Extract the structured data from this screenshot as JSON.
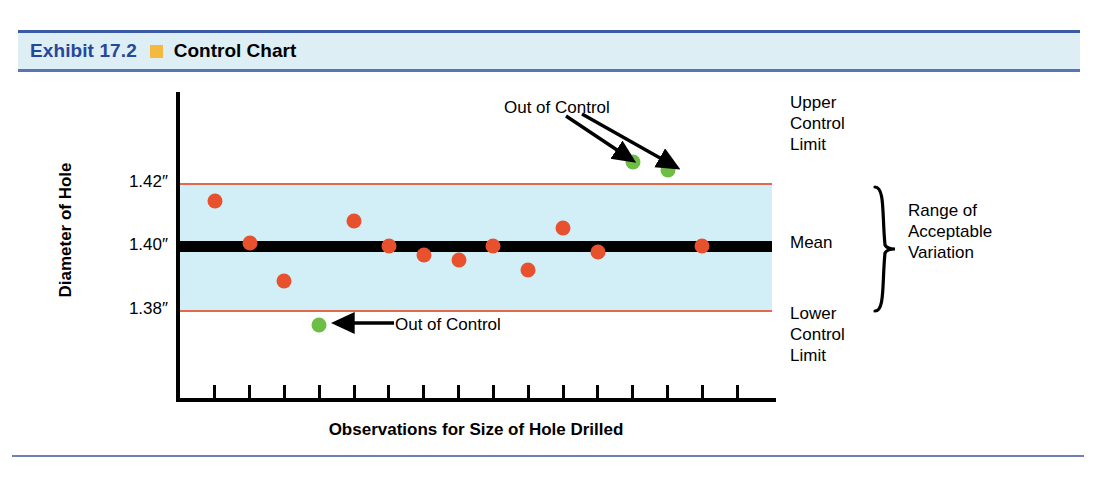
{
  "header": {
    "exhibit_number": "Exhibit 17.2",
    "title": "Control Chart",
    "bullet_color": "#f5b942",
    "number_color": "#27479b",
    "banner_color": "#ddeef4",
    "rule_color": "#3c5ba6"
  },
  "chart_data": {
    "type": "scatter",
    "title": "Control Chart",
    "xlabel": "Observations for Size of Hole Drilled",
    "ylabel": "Diameter of Hole",
    "ytick_labels": [
      "1.42″",
      "1.40″",
      "1.38″"
    ],
    "ytick_values": [
      1.42,
      1.4,
      1.38
    ],
    "ylim": [
      1.365,
      1.435
    ],
    "grid": false,
    "legend": "none",
    "n_x_ticks": 16,
    "reference_lines": [
      {
        "name": "upper-control-limit",
        "label": "Upper\nControl\nLimit",
        "value": 1.42,
        "color": "#e06a4a"
      },
      {
        "name": "mean",
        "label": "Mean",
        "value": 1.4,
        "color": "#000000"
      },
      {
        "name": "lower-control-limit",
        "label": "Lower\nControl\nLimit",
        "value": 1.38,
        "color": "#e06a4a"
      }
    ],
    "band_label": "Range of\nAcceptable\nVariation",
    "band_color": "#d2eef6",
    "series": [
      {
        "name": "in-control",
        "color": "#e8512e",
        "points": [
          {
            "x": 1,
            "y": 1.4145
          },
          {
            "x": 2,
            "y": 1.4015
          },
          {
            "x": 3,
            "y": 1.3895
          },
          {
            "x": 5,
            "y": 1.4085
          },
          {
            "x": 6,
            "y": 1.4005
          },
          {
            "x": 7,
            "y": 1.3975
          },
          {
            "x": 8,
            "y": 1.396
          },
          {
            "x": 9,
            "y": 1.4005
          },
          {
            "x": 10,
            "y": 1.393
          },
          {
            "x": 11,
            "y": 1.406
          },
          {
            "x": 12,
            "y": 1.3985
          },
          {
            "x": 15,
            "y": 1.4005
          }
        ]
      },
      {
        "name": "out-of-control",
        "color": "#6cbe45",
        "points": [
          {
            "x": 4,
            "y": 1.3755
          },
          {
            "x": 13,
            "y": 1.427
          },
          {
            "x": 14,
            "y": 1.4245
          }
        ]
      }
    ],
    "annotations": [
      {
        "name": "out-of-control-upper",
        "text": "Out of Control",
        "arrows": 2
      },
      {
        "name": "out-of-control-lower",
        "text": "Out of Control",
        "arrows": 1
      }
    ]
  }
}
